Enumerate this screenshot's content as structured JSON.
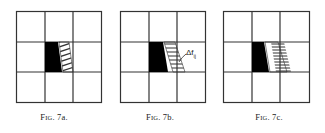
{
  "figures": [
    {
      "id": "7a",
      "caption_prefix": "F",
      "caption_smallcaps": "IG",
      "caption_suffix": ". 7a.",
      "hatch": "diagonal",
      "annotation": ""
    },
    {
      "id": "7b",
      "caption_prefix": "F",
      "caption_smallcaps": "IG",
      "caption_suffix": ". 7b.",
      "hatch": "horizontal",
      "annotation": "Δf",
      "annotation_sub": "ij"
    },
    {
      "id": "7c",
      "caption_prefix": "F",
      "caption_smallcaps": "IG",
      "caption_suffix": ". 7c.",
      "hatch": "horizontal-dense",
      "annotation": ""
    }
  ],
  "colors": {
    "grid_line": "#333333",
    "filled_region": "#000000",
    "hatch": "#333333",
    "background": "#ffffff"
  }
}
